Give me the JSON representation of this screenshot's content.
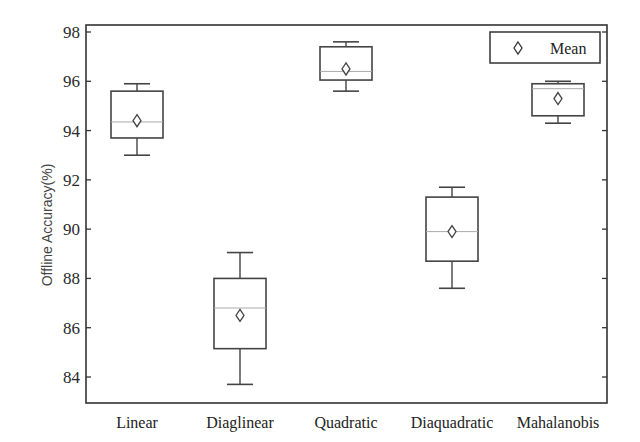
{
  "chart_data": {
    "type": "box",
    "title": "",
    "xlabel": "",
    "ylabel": "Offline Accuracy(%)",
    "ylim": [
      83.0,
      98.3
    ],
    "yticks": [
      84,
      86,
      88,
      90,
      92,
      94,
      96,
      98
    ],
    "grid": false,
    "legend": {
      "position": "upper right",
      "entries": [
        {
          "marker": "diamond",
          "label": "Mean"
        }
      ]
    },
    "categories": [
      "Linear",
      "Diaglinear",
      "Quadratic",
      "Diaquadratic",
      "Mahalanobis"
    ],
    "series": [
      {
        "name": "Linear",
        "whisker_low": 93.0,
        "q1": 93.7,
        "median": 94.35,
        "q3": 95.6,
        "whisker_high": 95.9,
        "mean": 94.4
      },
      {
        "name": "Diaglinear",
        "whisker_low": 83.7,
        "q1": 85.15,
        "median": 86.8,
        "q3": 88.0,
        "whisker_high": 89.05,
        "mean": 86.5
      },
      {
        "name": "Quadratic",
        "whisker_low": 95.6,
        "q1": 96.05,
        "median": 96.4,
        "q3": 97.4,
        "whisker_high": 97.6,
        "mean": 96.5
      },
      {
        "name": "Diaquadratic",
        "whisker_low": 87.6,
        "q1": 88.7,
        "median": 89.9,
        "q3": 91.3,
        "whisker_high": 91.7,
        "mean": 89.9
      },
      {
        "name": "Mahalanobis",
        "whisker_low": 94.3,
        "q1": 94.6,
        "median": 95.7,
        "q3": 95.9,
        "whisker_high": 96.0,
        "mean": 95.3
      }
    ]
  },
  "colors": {
    "axis": "#333333",
    "box": "#444444",
    "median": "#aaaaaa",
    "background": "#ffffff"
  }
}
